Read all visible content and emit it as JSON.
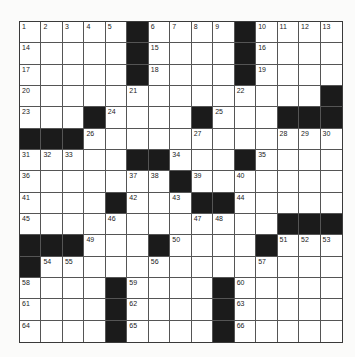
{
  "puzzle": {
    "rows": 15,
    "cols": 15,
    "colors": {
      "block": "#1b1b1b",
      "cell": "#ffffff",
      "line": "#555555"
    },
    "grid": [
      [
        "1",
        "2",
        "3",
        "4",
        "5",
        "#",
        "6",
        "7",
        "8",
        "9",
        "#",
        "10",
        "11",
        "12",
        "13"
      ],
      [
        "14",
        ".",
        ".",
        ".",
        ".",
        "#",
        "15",
        ".",
        ".",
        ".",
        "#",
        "16",
        ".",
        ".",
        "."
      ],
      [
        "17",
        ".",
        ".",
        ".",
        ".",
        "#",
        "18",
        ".",
        ".",
        ".",
        "#",
        "19",
        ".",
        ".",
        "."
      ],
      [
        "20",
        ".",
        ".",
        ".",
        ".",
        "21",
        ".",
        ".",
        ".",
        ".",
        "22",
        ".",
        ".",
        ".",
        "#"
      ],
      [
        "23",
        ".",
        ".",
        "#",
        "24",
        ".",
        ".",
        ".",
        "#",
        "25",
        ".",
        ".",
        "#",
        "#",
        "#"
      ],
      [
        "#",
        "#",
        "#",
        "26",
        ".",
        ".",
        ".",
        ".",
        "27",
        ".",
        ".",
        ".",
        "28",
        "29",
        "30"
      ],
      [
        "31",
        "32",
        "33",
        ".",
        ".",
        "#",
        "#",
        "34",
        ".",
        ".",
        "#",
        "35",
        ".",
        ".",
        "."
      ],
      [
        "36",
        ".",
        ".",
        ".",
        ".",
        "37",
        "38",
        "#",
        "39",
        ".",
        "40",
        ".",
        ".",
        ".",
        "."
      ],
      [
        "41",
        ".",
        ".",
        ".",
        "#",
        "42",
        ".",
        "43",
        "#",
        "#",
        "44",
        ".",
        ".",
        ".",
        "."
      ],
      [
        "45",
        ".",
        ".",
        ".",
        "46",
        ".",
        ".",
        ".",
        "47",
        "48",
        ".",
        ".",
        "#",
        "#",
        "#"
      ],
      [
        "#",
        "#",
        "#",
        "49",
        ".",
        ".",
        "#",
        "50",
        ".",
        ".",
        ".",
        "#",
        "51",
        "52",
        "53"
      ],
      [
        "#",
        "54",
        "55",
        ".",
        ".",
        ".",
        "56",
        ".",
        ".",
        ".",
        ".",
        "57",
        ".",
        ".",
        "."
      ],
      [
        "58",
        ".",
        ".",
        ".",
        "#",
        "59",
        ".",
        ".",
        ".",
        "#",
        "60",
        ".",
        ".",
        ".",
        "."
      ],
      [
        "61",
        ".",
        ".",
        ".",
        "#",
        "62",
        ".",
        ".",
        ".",
        "#",
        "63",
        ".",
        ".",
        ".",
        "."
      ],
      [
        "64",
        ".",
        ".",
        ".",
        "#",
        "65",
        ".",
        ".",
        ".",
        "#",
        "66",
        ".",
        ".",
        ".",
        "."
      ]
    ]
  }
}
